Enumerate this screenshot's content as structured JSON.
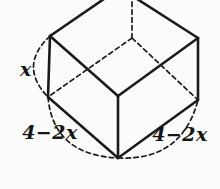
{
  "figure": {
    "background_color": "#fcfcfc",
    "line_color": "#1b1b1b",
    "labels": {
      "height_edge": "x",
      "base_front_left_edge": "4−2x",
      "base_front_right_edge": "4−2x"
    }
  }
}
